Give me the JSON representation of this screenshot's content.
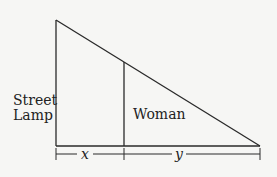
{
  "diagram": {
    "labels": {
      "lamp_line1": "Street",
      "lamp_line2": "Lamp",
      "woman": "Woman",
      "x": "x",
      "y": "y"
    },
    "colors": {
      "line": "#2a2a2a",
      "background": "#f6f6f4"
    }
  }
}
